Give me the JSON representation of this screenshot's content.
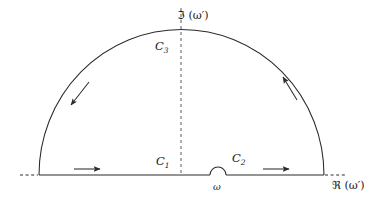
{
  "figure": {
    "background_color": "#ffffff",
    "stroke_color": "#2b2b2b",
    "axes": {
      "imaginary_label": "ℑ (ω′)",
      "real_label": "ℜ (ω′)"
    },
    "labels": {
      "c1": "C",
      "c1_sub": "1",
      "c2": "C",
      "c2_sub": "2",
      "c3": "C",
      "c3_sub": "3",
      "pole": "ω"
    },
    "geometry": {
      "baseline_y": 175,
      "arc_left_x": 39,
      "arc_right_x": 324,
      "arc_apex_x": 181,
      "arc_apex_y": 30,
      "arc_radius_x": 142,
      "arc_radius_y": 145,
      "pole_x": 218,
      "pole_bump_radius": 8,
      "dashed_axis_x": 181,
      "dashed_axis_top_y": 8,
      "dashed_left_start_x": 20,
      "dashed_right_end_x": 345
    },
    "direction_arrows": [
      {
        "name": "arrow-c1-right",
        "x": 88,
        "y": 170,
        "rotation": 0,
        "description": "rightward along real axis, segment C1"
      },
      {
        "name": "arrow-c2-right",
        "x": 277,
        "y": 170,
        "rotation": 0,
        "description": "rightward along real axis, segment C2"
      },
      {
        "name": "arrow-arc-right-up",
        "x": 289,
        "y": 88,
        "rotation": -62,
        "description": "counterclockwise up the right side of arc C3"
      },
      {
        "name": "arrow-arc-left-down",
        "x": 77,
        "y": 96,
        "rotation": 118,
        "description": "counterclockwise down the left side of arc C3"
      }
    ]
  }
}
